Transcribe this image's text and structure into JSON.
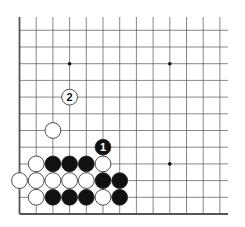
{
  "diagram": {
    "type": "go-board-partial",
    "corner": "bottom-left",
    "columns_visible": 13,
    "rows_visible": 12,
    "star_points": [
      [
        3,
        9
      ],
      [
        9,
        9
      ],
      [
        9,
        3
      ]
    ],
    "stones": [
      {
        "col": 0,
        "row": 2,
        "color": "white",
        "label": ""
      },
      {
        "col": 1,
        "row": 2,
        "color": "white",
        "label": ""
      },
      {
        "col": 2,
        "row": 2,
        "color": "white",
        "label": ""
      },
      {
        "col": 3,
        "row": 2,
        "color": "white",
        "label": ""
      },
      {
        "col": 4,
        "row": 2,
        "color": "white",
        "label": ""
      },
      {
        "col": 5,
        "row": 2,
        "color": "black",
        "label": ""
      },
      {
        "col": 6,
        "row": 2,
        "color": "black",
        "label": ""
      },
      {
        "col": 1,
        "row": 1,
        "color": "white",
        "label": ""
      },
      {
        "col": 2,
        "row": 1,
        "color": "black",
        "label": ""
      },
      {
        "col": 3,
        "row": 1,
        "color": "black",
        "label": ""
      },
      {
        "col": 4,
        "row": 1,
        "color": "black",
        "label": ""
      },
      {
        "col": 5,
        "row": 1,
        "color": "white",
        "label": ""
      },
      {
        "col": 6,
        "row": 1,
        "color": "black",
        "label": ""
      },
      {
        "col": 1,
        "row": 3,
        "color": "white",
        "label": ""
      },
      {
        "col": 2,
        "row": 3,
        "color": "black",
        "label": ""
      },
      {
        "col": 3,
        "row": 3,
        "color": "black",
        "label": ""
      },
      {
        "col": 4,
        "row": 3,
        "color": "black",
        "label": ""
      },
      {
        "col": 5,
        "row": 3,
        "color": "white",
        "label": ""
      },
      {
        "col": 5,
        "row": 4,
        "color": "black",
        "label": "1"
      },
      {
        "col": 2,
        "row": 5,
        "color": "white",
        "label": ""
      },
      {
        "col": 3,
        "row": 7,
        "color": "white",
        "label": "2"
      }
    ]
  }
}
